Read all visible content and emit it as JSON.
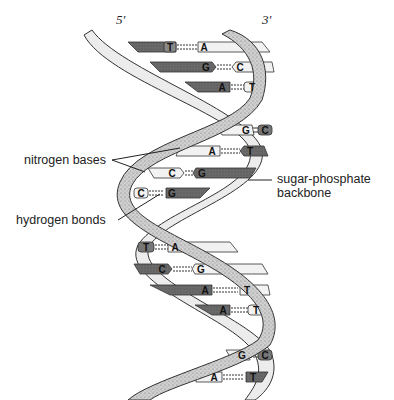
{
  "diagram": {
    "strand_ends": {
      "left": "5'",
      "right": "3'"
    },
    "labels": {
      "nitrogen_bases": "nitrogen bases",
      "hydrogen_bonds": "hydrogen bonds",
      "backbone_line1": "sugar-phosphate",
      "backbone_line2": "backbone"
    },
    "base_pairs": [
      {
        "left": "T",
        "right": "A"
      },
      {
        "left": "G",
        "right": "C"
      },
      {
        "left": "A",
        "right": "T"
      },
      {
        "left": "G",
        "right": "C"
      },
      {
        "left": "A",
        "right": "T"
      },
      {
        "left": "C",
        "right": "G"
      },
      {
        "left": "C",
        "right": "G"
      },
      {
        "left": "T",
        "right": "A"
      },
      {
        "left": "C",
        "right": "G"
      },
      {
        "left": "A",
        "right": "T"
      },
      {
        "left": "A",
        "right": "T"
      },
      {
        "left": "G",
        "right": "C"
      },
      {
        "left": "A",
        "right": "T"
      }
    ],
    "colors": {
      "dark_base": "#6e6e6e",
      "light_base": "#f2f2f2",
      "backbone_light": "#ececec",
      "backbone_shaded": "#bdbdbd",
      "ink": "#222222"
    }
  }
}
